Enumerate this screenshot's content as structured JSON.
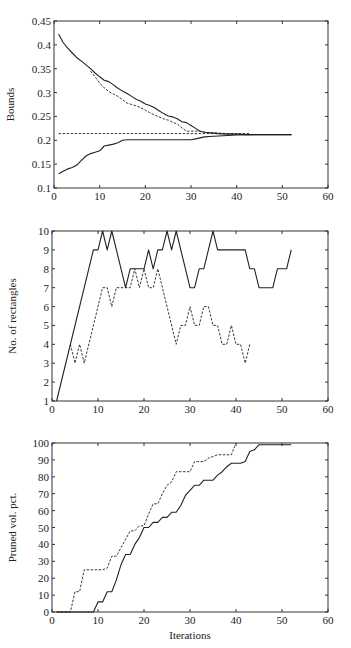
{
  "figure": {
    "xlabel_shared": "Iterations"
  },
  "chart_data": [
    {
      "type": "line",
      "title": "",
      "xlabel": "",
      "ylabel": "Bounds",
      "xlim": [
        0,
        60
      ],
      "ylim": [
        0.1,
        0.45
      ],
      "xticks": [
        0,
        10,
        20,
        30,
        40,
        50,
        60
      ],
      "yticks": [
        0.1,
        0.15,
        0.2,
        0.25,
        0.3,
        0.35,
        0.4,
        0.45
      ],
      "ytick_labels": [
        "0.1",
        "0.15",
        "0.2",
        "0.25",
        "0.3",
        "0.35",
        "0.4",
        "0.45"
      ],
      "grid": false,
      "legend": null,
      "series": [
        {
          "name": "upper bound (solid)",
          "style": "solid",
          "x": [
            1,
            2,
            3,
            4,
            5,
            6,
            7,
            8,
            9,
            10,
            11,
            12,
            13,
            14,
            15,
            16,
            17,
            18,
            19,
            20,
            21,
            22,
            23,
            24,
            25,
            26,
            27,
            28,
            29,
            30,
            31,
            32,
            33,
            34,
            35,
            36,
            38,
            40,
            42,
            44,
            46,
            48,
            50,
            52
          ],
          "y": [
            0.423,
            0.405,
            0.393,
            0.383,
            0.373,
            0.366,
            0.358,
            0.35,
            0.341,
            0.333,
            0.326,
            0.323,
            0.316,
            0.309,
            0.303,
            0.298,
            0.292,
            0.286,
            0.282,
            0.276,
            0.273,
            0.268,
            0.262,
            0.256,
            0.251,
            0.249,
            0.245,
            0.239,
            0.237,
            0.231,
            0.225,
            0.219,
            0.217,
            0.216,
            0.215,
            0.214,
            0.213,
            0.213,
            0.212,
            0.212,
            0.212,
            0.212,
            0.212,
            0.212
          ]
        },
        {
          "name": "upper bound estimate (dashed)",
          "style": "dashed",
          "x": [
            8,
            9,
            10,
            11,
            12,
            13,
            14,
            15,
            16,
            17,
            18,
            19,
            20,
            21,
            22,
            23,
            24,
            25,
            26,
            27,
            28,
            29,
            30,
            31,
            32,
            33,
            34,
            36,
            38,
            40,
            43
          ],
          "y": [
            0.345,
            0.333,
            0.32,
            0.31,
            0.302,
            0.297,
            0.292,
            0.285,
            0.278,
            0.275,
            0.272,
            0.268,
            0.263,
            0.258,
            0.253,
            0.249,
            0.245,
            0.242,
            0.238,
            0.234,
            0.226,
            0.219,
            0.219,
            0.219,
            0.219,
            0.217,
            0.216,
            0.215,
            0.214,
            0.213,
            0.212
          ]
        },
        {
          "name": "reference (dashed horizontal)",
          "style": "dashed",
          "x": [
            1,
            43
          ],
          "y": [
            0.214,
            0.214
          ]
        },
        {
          "name": "lower bound (solid)",
          "style": "solid",
          "x": [
            1,
            2,
            3,
            4,
            5,
            6,
            7,
            8,
            9,
            10,
            11,
            12,
            13,
            14,
            15,
            16,
            20,
            25,
            30,
            31,
            32,
            33,
            34,
            36,
            38,
            40,
            45,
            50,
            52
          ],
          "y": [
            0.13,
            0.135,
            0.14,
            0.143,
            0.148,
            0.158,
            0.167,
            0.172,
            0.175,
            0.178,
            0.188,
            0.19,
            0.192,
            0.195,
            0.2,
            0.201,
            0.201,
            0.201,
            0.201,
            0.203,
            0.205,
            0.207,
            0.208,
            0.209,
            0.21,
            0.211,
            0.212,
            0.212,
            0.212
          ]
        }
      ]
    },
    {
      "type": "line",
      "title": "",
      "xlabel": "",
      "ylabel": "No. of rectangles",
      "xlim": [
        0,
        60
      ],
      "ylim": [
        1,
        10
      ],
      "xticks": [
        0,
        10,
        20,
        30,
        40,
        50,
        60
      ],
      "yticks": [
        1,
        2,
        3,
        4,
        5,
        6,
        7,
        8,
        9,
        10
      ],
      "ytick_labels": [
        "1",
        "2",
        "3",
        "4",
        "5",
        "6",
        "7",
        "8",
        "9",
        "10"
      ],
      "grid": false,
      "legend": null,
      "series": [
        {
          "name": "solid",
          "style": "solid",
          "x": [
            1,
            9,
            10,
            11,
            12,
            13,
            16,
            17,
            18,
            19,
            20,
            21,
            22,
            23,
            24,
            25,
            26,
            27,
            30,
            31,
            32,
            33,
            35,
            36,
            37,
            42,
            43,
            44,
            45,
            46,
            47,
            48,
            49,
            50,
            51,
            52
          ],
          "y": [
            1,
            9,
            9,
            10,
            9,
            10,
            7,
            8,
            8,
            8,
            8,
            9,
            8,
            9,
            9,
            10,
            9,
            10,
            7,
            7,
            8,
            8,
            10,
            9,
            9,
            9,
            8,
            8,
            7,
            7,
            7,
            7,
            8,
            8,
            8,
            9
          ]
        },
        {
          "name": "dashed",
          "style": "dashed",
          "x": [
            4,
            5,
            6,
            7,
            11,
            12,
            13,
            14,
            15,
            16,
            17,
            18,
            19,
            20,
            21,
            22,
            23,
            27,
            28,
            29,
            30,
            31,
            32,
            33,
            34,
            35,
            36,
            37,
            38,
            39,
            40,
            41,
            42,
            43
          ],
          "y": [
            4,
            3,
            4,
            3,
            7,
            7,
            6,
            7,
            7,
            7,
            7,
            8,
            7,
            8,
            7,
            7,
            8,
            4,
            5,
            5,
            6,
            5,
            5,
            6,
            6,
            5,
            5,
            4,
            4,
            5,
            4,
            4,
            3,
            4
          ]
        }
      ]
    },
    {
      "type": "line",
      "title": "",
      "xlabel": "Iterations",
      "ylabel": "Pruned vol. pct.",
      "xlim": [
        0,
        60
      ],
      "ylim": [
        0,
        100
      ],
      "xticks": [
        0,
        10,
        20,
        30,
        40,
        50,
        60
      ],
      "yticks": [
        0,
        10,
        20,
        30,
        40,
        50,
        60,
        70,
        80,
        90,
        100
      ],
      "ytick_labels": [
        "0",
        "10",
        "20",
        "30",
        "40",
        "50",
        "60",
        "70",
        "80",
        "90",
        "100"
      ],
      "grid": false,
      "legend": null,
      "series": [
        {
          "name": "solid",
          "style": "solid",
          "x": [
            1,
            9,
            10,
            11,
            12,
            13,
            14,
            15,
            16,
            17,
            18,
            19,
            20,
            21,
            22,
            23,
            24,
            25,
            26,
            27,
            28,
            29,
            30,
            31,
            32,
            33,
            34,
            35,
            36,
            37,
            38,
            39,
            40,
            41,
            42,
            43,
            44,
            45,
            46,
            50,
            52
          ],
          "y": [
            0,
            0,
            6,
            6,
            12,
            12,
            19,
            28,
            34,
            34,
            40,
            44,
            50,
            50,
            53,
            53,
            56,
            56,
            59,
            59,
            63,
            69,
            72,
            75,
            75,
            78,
            78,
            78,
            81,
            83,
            86,
            88,
            88,
            88,
            89,
            95,
            96,
            99,
            99,
            99,
            99
          ]
        },
        {
          "name": "dashed",
          "style": "dashed",
          "x": [
            1,
            4,
            5,
            6,
            7,
            11,
            12,
            13,
            14,
            15,
            16,
            17,
            18,
            19,
            20,
            21,
            22,
            23,
            24,
            25,
            26,
            27,
            28,
            29,
            30,
            31,
            32,
            33,
            34,
            35,
            36,
            37,
            38,
            39,
            40
          ],
          "y": [
            0,
            0,
            12,
            12,
            25,
            25,
            26,
            33,
            33,
            38,
            43,
            48,
            48,
            51,
            51,
            58,
            64,
            64,
            70,
            75,
            77,
            83,
            83,
            83,
            83,
            89,
            89,
            89,
            91,
            92,
            93,
            93,
            93,
            93,
            100
          ]
        }
      ]
    }
  ]
}
